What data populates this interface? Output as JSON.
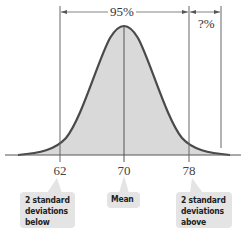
{
  "diagram": {
    "type": "normal-distribution",
    "top_brackets": [
      {
        "label": "95%",
        "from": 62,
        "to": 78
      },
      {
        "label": "?%",
        "from": 78,
        "to": "right edge"
      }
    ],
    "axis": {
      "ticks": [
        {
          "value": "62"
        },
        {
          "value": "70"
        },
        {
          "value": "78"
        }
      ]
    },
    "callouts": [
      {
        "lines": [
          "2 standard",
          "deviations",
          "below mean"
        ],
        "points_to": "62"
      },
      {
        "lines": [
          "Mean"
        ],
        "points_to": "70"
      },
      {
        "lines": [
          "2 standard",
          "deviations",
          "above mean"
        ],
        "points_to": "78"
      }
    ],
    "colors": {
      "curve": "#4a4a4a",
      "fill": "#d9d9d9",
      "lines": "#555555",
      "callout_bg": "#e4e4e4"
    }
  }
}
